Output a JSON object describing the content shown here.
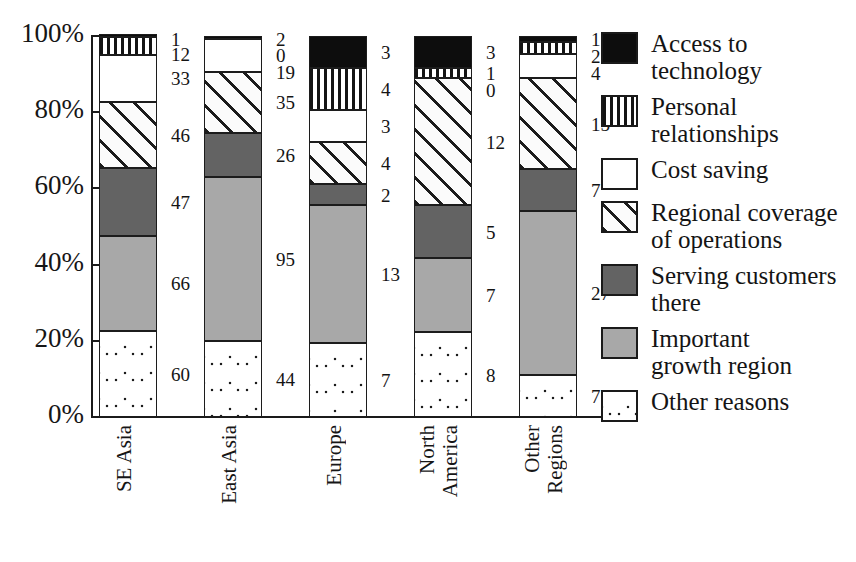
{
  "chart_data": {
    "type": "bar",
    "subtype": "stacked-100-percent",
    "title": "",
    "xlabel": "",
    "ylabel": "",
    "ylim": [
      0,
      100
    ],
    "ytick_labels": [
      "100%",
      "80%",
      "60%",
      "40%",
      "20%",
      "0%"
    ],
    "ytick_values": [
      100,
      80,
      60,
      40,
      20,
      0
    ],
    "grid": false,
    "legend_position": "right",
    "categories": [
      "SE Asia",
      "East Asia",
      "Europe",
      "North America",
      "Other Regions"
    ],
    "category_label_lines": [
      [
        "SE Asia"
      ],
      [
        "East Asia"
      ],
      [
        "Europe"
      ],
      [
        "North",
        "America"
      ],
      [
        "Other",
        "Regions"
      ]
    ],
    "series": [
      {
        "name": "Access to technology",
        "pattern": "solid-black",
        "values": [
          1,
          2,
          3,
          3,
          1
        ]
      },
      {
        "name": "Personal relationships",
        "pattern": "vertical-lines",
        "values": [
          12,
          0,
          4,
          1,
          2
        ]
      },
      {
        "name": "Cost saving",
        "pattern": "white",
        "values": [
          33,
          19,
          3,
          0,
          4
        ]
      },
      {
        "name": "Regional coverage of operations",
        "pattern": "diagonal-hatch",
        "values": [
          46,
          35,
          4,
          12,
          15
        ]
      },
      {
        "name": "Serving customers there",
        "pattern": "dark-gray",
        "values": [
          47,
          26,
          2,
          5,
          7
        ]
      },
      {
        "name": "Important growth region",
        "pattern": "medium-gray",
        "values": [
          66,
          95,
          13,
          7,
          27
        ]
      },
      {
        "name": "Other reasons",
        "pattern": "dotted",
        "values": [
          60,
          44,
          7,
          8,
          7
        ]
      }
    ]
  },
  "legend": {
    "items": [
      {
        "label": "Access to technology",
        "label_lines": [
          "Access to",
          "technology"
        ]
      },
      {
        "label": "Personal relationships",
        "label_lines": [
          "Personal",
          "relationships"
        ]
      },
      {
        "label": "Cost saving",
        "label_lines": [
          "Cost saving"
        ]
      },
      {
        "label": "Regional coverage of operations",
        "label_lines": [
          "Regional coverage",
          "of operations"
        ]
      },
      {
        "label": "Serving customers there",
        "label_lines": [
          "Serving customers",
          "there"
        ]
      },
      {
        "label": "Important growth region",
        "label_lines": [
          "Important",
          "growth region"
        ]
      },
      {
        "label": "Other reasons",
        "label_lines": [
          "Other reasons"
        ]
      }
    ]
  },
  "colors": {
    "axis": "#1a1a1a",
    "text": "#141414",
    "background": "#ffffff",
    "dark_gray": "#636363",
    "medium_gray": "#a8a8a8",
    "black": "#0d0d0d"
  }
}
